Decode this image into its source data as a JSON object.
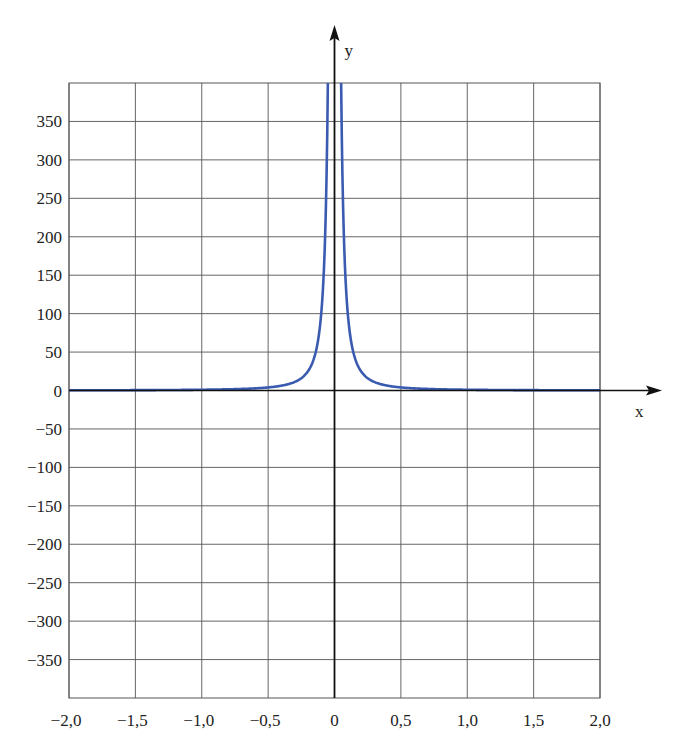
{
  "chart_data": {
    "type": "line",
    "title": "",
    "xlabel": "x",
    "ylabel": "y",
    "function": "y = 1/x^2",
    "xlim": [
      -2.0,
      2.0
    ],
    "ylim": [
      -400,
      400
    ],
    "grid": true,
    "legend": null,
    "x_ticks": [
      -2.0,
      -1.5,
      -1.0,
      -0.5,
      0,
      0.5,
      1.0,
      1.5,
      2.0
    ],
    "x_tick_labels": [
      "−2,0",
      "−1,5",
      "−1,0",
      "−0,5",
      "0",
      "0,5",
      "1,0",
      "1,5",
      "2,0"
    ],
    "y_ticks": [
      350,
      300,
      250,
      200,
      150,
      100,
      50,
      0,
      -50,
      -100,
      -150,
      -200,
      -250,
      -300,
      -350
    ],
    "y_tick_labels": [
      "350",
      "300",
      "250",
      "200",
      "150",
      "100",
      "50",
      "0",
      "−50",
      "−100",
      "−150",
      "−200",
      "−250",
      "−300",
      "−350"
    ],
    "series": [
      {
        "name": "y = 1/x²",
        "color": "#3a5bb0",
        "x": [
          -2.0,
          -1.5,
          -1.0,
          -0.75,
          -0.5,
          -0.4,
          -0.3,
          -0.25,
          -0.2,
          -0.15,
          -0.1,
          -0.075,
          -0.06,
          -0.05,
          0.05,
          0.06,
          0.075,
          0.1,
          0.15,
          0.2,
          0.25,
          0.3,
          0.4,
          0.5,
          0.75,
          1.0,
          1.5,
          2.0
        ],
        "y": [
          0.25,
          0.44,
          1,
          1.78,
          4,
          6.25,
          11.1,
          16,
          25,
          44.4,
          100,
          177.8,
          277.8,
          400,
          400,
          277.8,
          177.8,
          100,
          44.4,
          25,
          16,
          11.1,
          6.25,
          4,
          1.78,
          1,
          0.44,
          0.25
        ]
      }
    ]
  },
  "colors": {
    "grid": "#555555",
    "axis": "#111111",
    "curve": "#3a5bb0"
  }
}
